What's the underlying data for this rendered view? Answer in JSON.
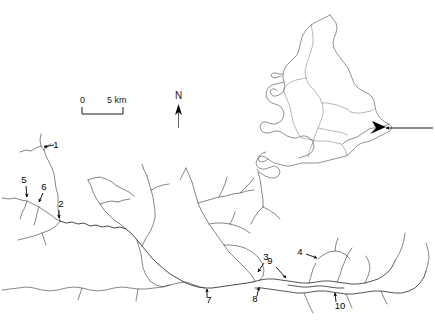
{
  "figure": {
    "type": "map",
    "background_color": "#ffffff",
    "line_color": "#3a3a3a",
    "width": 435,
    "height": 321
  },
  "scale_bar": {
    "name": "scale-bar",
    "start_label": "0",
    "end_label": "5 km",
    "units": "km",
    "length_value": 5
  },
  "north_arrow": {
    "name": "north-arrow",
    "label": "N"
  },
  "site_labels": [
    {
      "id": "1",
      "text": "1",
      "label_x": 56,
      "label_y": 148,
      "tip_x": 42,
      "tip_y": 146,
      "dir": "left-down"
    },
    {
      "id": "2",
      "text": "2",
      "label_x": 61,
      "label_y": 207,
      "tip_x": 59,
      "tip_y": 219,
      "dir": "down"
    },
    {
      "id": "3",
      "text": "3",
      "label_x": 266,
      "label_y": 260,
      "tip_x": 257,
      "tip_y": 273,
      "dir": "down-left"
    },
    {
      "id": "4",
      "text": "4",
      "label_x": 300,
      "label_y": 255,
      "tip_x": 318,
      "tip_y": 259,
      "dir": "right"
    },
    {
      "id": "5",
      "text": "5",
      "label_x": 24,
      "label_y": 183,
      "tip_x": 27,
      "tip_y": 198,
      "dir": "down"
    },
    {
      "id": "6",
      "text": "6",
      "label_x": 44,
      "label_y": 190,
      "tip_x": 38,
      "tip_y": 203,
      "dir": "down-left"
    },
    {
      "id": "7",
      "text": "7",
      "label_x": 209,
      "label_y": 303,
      "tip_x": 207,
      "tip_y": 288,
      "dir": "up"
    },
    {
      "id": "8",
      "text": "8",
      "label_x": 255,
      "label_y": 302,
      "tip_x": 259,
      "tip_y": 286,
      "dir": "up"
    },
    {
      "id": "9",
      "text": "9",
      "label_x": 270,
      "label_y": 264,
      "tip_x": 286,
      "tip_y": 279,
      "dir": "down-right"
    },
    {
      "id": "10",
      "text": "10",
      "label_x": 340,
      "label_y": 309,
      "tip_x": 335,
      "tip_y": 292,
      "dir": "up"
    }
  ],
  "inset_map": {
    "name": "inset-locator-map",
    "region": "England and Wales",
    "pointer": {
      "name": "inset-pointer-arrow",
      "points_to": "Thames estuary",
      "tip_x": 382,
      "tip_y": 128,
      "tail_x": 433,
      "tail_y": 128
    }
  }
}
